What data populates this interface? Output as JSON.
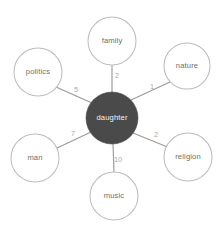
{
  "graph": {
    "center_node": {
      "id": "daughter",
      "label": "daughter",
      "radius": 26,
      "cx": 112,
      "cy": 118,
      "fill": "#4a4a4a",
      "text_color": "#f2f2f2"
    },
    "peripheral_nodes": [
      {
        "id": "family",
        "label": "family",
        "cx": 112,
        "cy": 41,
        "radius": 24
      },
      {
        "id": "nature",
        "label": "nature",
        "cx": 187,
        "cy": 66,
        "radius": 23
      },
      {
        "id": "religion",
        "label": "religion",
        "cx": 188,
        "cy": 157,
        "radius": 24
      },
      {
        "id": "music",
        "label": "music",
        "cx": 114,
        "cy": 196,
        "radius": 24
      },
      {
        "id": "man",
        "label": "man",
        "cx": 35,
        "cy": 158,
        "radius": 24
      },
      {
        "id": "politics",
        "label": "politics",
        "cx": 38,
        "cy": 72,
        "radius": 24
      }
    ],
    "edges": [
      {
        "source": "daughter",
        "target": "family",
        "weight": "2",
        "label_x": 117,
        "label_y": 76
      },
      {
        "source": "daughter",
        "target": "nature",
        "weight": "1",
        "label_x": 152,
        "label_y": 92
      },
      {
        "source": "daughter",
        "target": "religion",
        "weight": "2",
        "label_x": 156,
        "label_y": 137
      },
      {
        "source": "daughter",
        "target": "music",
        "weight": "10",
        "label_x": 117,
        "label_y": 160
      },
      {
        "source": "daughter",
        "target": "man",
        "weight": "7",
        "label_x": 72,
        "label_y": 137
      },
      {
        "source": "daughter",
        "target": "politics",
        "weight": "5",
        "label_x": 75,
        "label_y": 93
      }
    ],
    "colors": {
      "background": "#ffffff",
      "edge_stroke": "#9a9a9a",
      "node_stroke": "#bdbdbd",
      "node_fill": "#ffffff",
      "center_fill": "#4a4a4a",
      "label_text": "#6d6d6d",
      "weight_text": "#a8a8a8",
      "center_text": "#f2f2f2"
    }
  }
}
